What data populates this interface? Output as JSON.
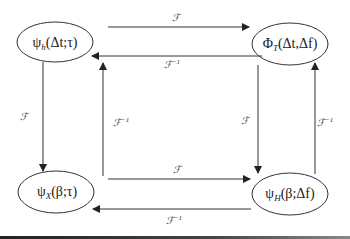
{
  "nodes": {
    "top_left": {
      "main": "ψ",
      "sub": "h",
      "args": "(Δt;τ)"
    },
    "top_right": {
      "main": "Φ",
      "sub": "T",
      "args": "(Δt,Δf)"
    },
    "bottom_left": {
      "main": "ψ",
      "sub": "X",
      "args": "(β;τ)"
    },
    "bottom_right": {
      "main": "ψ",
      "sub": "H",
      "args": "(β;Δf)"
    }
  },
  "edges": {
    "forward_label": "ℱ",
    "inverse_label": "ℱ",
    "inverse_sup": "−1"
  }
}
